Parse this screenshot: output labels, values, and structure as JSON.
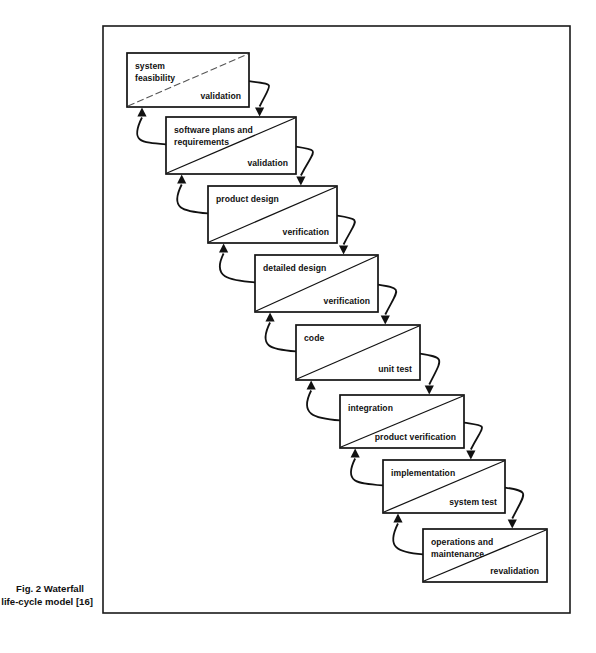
{
  "figure": {
    "caption_line_1": "Fig. 2    Waterfall",
    "caption_line_2": "life-cycle model [16]",
    "frame": {
      "x": 103,
      "y": 26,
      "width": 467,
      "height": 587
    },
    "colors": {
      "background": "#ffffff",
      "ink": "#111111",
      "frame_stroke": "#1a1a1a",
      "faint_diagonal": "#555555"
    }
  },
  "diagram": {
    "type": "waterfall-life-cycle",
    "direction": "top-left to bottom-right cascade",
    "phases": [
      {
        "id": "system-feasibility",
        "label_lines": [
          "system",
          "feasibility"
        ],
        "sublabel": "validation",
        "x": 127,
        "y": 53,
        "width": 122,
        "height": 54,
        "diagonal_style": "faint"
      },
      {
        "id": "software-plans-and-requirements",
        "label_lines": [
          "software plans and",
          "requirements"
        ],
        "sublabel": "validation",
        "x": 166,
        "y": 117,
        "width": 130,
        "height": 57,
        "diagonal_style": "solid"
      },
      {
        "id": "product-design",
        "label_lines": [
          "product design"
        ],
        "sublabel": "verification",
        "x": 208,
        "y": 186,
        "width": 129,
        "height": 57,
        "diagonal_style": "solid"
      },
      {
        "id": "detailed-design",
        "label_lines": [
          "detailed design"
        ],
        "sublabel": "verification",
        "x": 255,
        "y": 255,
        "width": 123,
        "height": 57,
        "diagonal_style": "solid"
      },
      {
        "id": "code",
        "label_lines": [
          "code"
        ],
        "sublabel": "unit test",
        "x": 296,
        "y": 325,
        "width": 124,
        "height": 55,
        "diagonal_style": "solid"
      },
      {
        "id": "integration",
        "label_lines": [
          "integration"
        ],
        "sublabel": "product verification",
        "x": 340,
        "y": 395,
        "width": 124,
        "height": 53,
        "diagonal_style": "solid"
      },
      {
        "id": "implementation",
        "label_lines": [
          "implementation"
        ],
        "sublabel": "system test",
        "x": 383,
        "y": 460,
        "width": 122,
        "height": 53,
        "diagonal_style": "solid"
      },
      {
        "id": "operations-and-maintenance",
        "label_lines": [
          "operations and",
          "maintenance"
        ],
        "sublabel": "revalidation",
        "x": 423,
        "y": 529,
        "width": 124,
        "height": 53,
        "diagonal_style": "solid"
      }
    ],
    "forward_arrows": [
      {
        "from": "system-feasibility",
        "to": "software-plans-and-requirements"
      },
      {
        "from": "software-plans-and-requirements",
        "to": "product-design"
      },
      {
        "from": "product-design",
        "to": "detailed-design"
      },
      {
        "from": "detailed-design",
        "to": "code"
      },
      {
        "from": "code",
        "to": "integration"
      },
      {
        "from": "integration",
        "to": "implementation"
      },
      {
        "from": "implementation",
        "to": "operations-and-maintenance"
      }
    ],
    "feedback_arrows": [
      {
        "from": "software-plans-and-requirements",
        "to": "system-feasibility"
      },
      {
        "from": "product-design",
        "to": "software-plans-and-requirements"
      },
      {
        "from": "detailed-design",
        "to": "product-design"
      },
      {
        "from": "code",
        "to": "detailed-design"
      },
      {
        "from": "integration",
        "to": "code"
      },
      {
        "from": "implementation",
        "to": "integration"
      },
      {
        "from": "operations-and-maintenance",
        "to": "implementation"
      }
    ]
  }
}
